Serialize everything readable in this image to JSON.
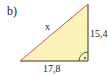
{
  "figure": {
    "part_label": "b)",
    "shape": "right-triangle",
    "right_angle_at": "bottom-right",
    "fill_color": "#fbf3b8",
    "hypotenuse_color": "#c8584a",
    "leg_color": "#333333",
    "labels": {
      "hypotenuse": "x",
      "vertical_leg": "15,4",
      "horizontal_leg": "17,8"
    },
    "right_angle_marker": "·"
  }
}
